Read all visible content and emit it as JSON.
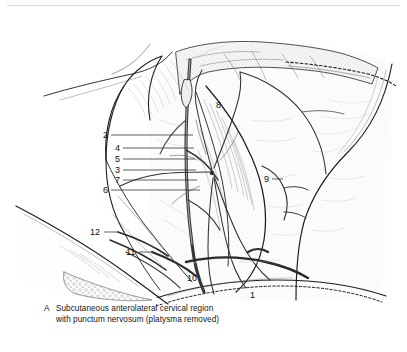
{
  "figure": {
    "name": "subcutaneous-anterolateral-cervical-region",
    "panel_letter": "A",
    "caption_line1": "Subcutaneous anterolateral cervical region",
    "caption_line2": "with punctum nervosum (platysma removed)",
    "style": {
      "background": "#ffffff",
      "ink": "#1a1a1a",
      "rule_color": "#d9d9d9",
      "leader_color": "#1a1a1a"
    },
    "labels": [
      {
        "id": "1",
        "text": "1",
        "x": 250,
        "y": 291,
        "leader": false
      },
      {
        "id": "2",
        "text": "2",
        "x": 103,
        "y": 131,
        "leader": true,
        "lx1": 111,
        "ly1": 135,
        "lx2": 193,
        "ly2": 135
      },
      {
        "id": "3",
        "text": "3",
        "x": 115,
        "y": 166,
        "leader": true,
        "lx1": 123,
        "ly1": 170,
        "lx2": 196,
        "ly2": 170
      },
      {
        "id": "4",
        "text": "4",
        "x": 115,
        "y": 144,
        "leader": true,
        "lx1": 123,
        "ly1": 148,
        "lx2": 194,
        "ly2": 148
      },
      {
        "id": "5",
        "text": "5",
        "x": 115,
        "y": 155,
        "leader": true,
        "lx1": 123,
        "ly1": 159,
        "lx2": 195,
        "ly2": 159
      },
      {
        "id": "6",
        "text": "6",
        "x": 103,
        "y": 186,
        "leader": true,
        "lx1": 111,
        "ly1": 190,
        "lx2": 200,
        "ly2": 190
      },
      {
        "id": "7",
        "text": "7",
        "x": 115,
        "y": 176,
        "leader": true,
        "lx1": 123,
        "ly1": 180,
        "lx2": 197,
        "ly2": 180
      },
      {
        "id": "8",
        "text": "8",
        "x": 216,
        "y": 101,
        "leader": false
      },
      {
        "id": "9",
        "text": "9",
        "x": 264,
        "y": 175,
        "leader": true,
        "lx1": 272,
        "ly1": 179,
        "lx2": 283,
        "ly2": 179
      },
      {
        "id": "10",
        "text": "10",
        "x": 187,
        "y": 274,
        "leader": false
      },
      {
        "id": "11",
        "text": "11",
        "x": 126,
        "y": 248,
        "leader": true,
        "lx1": 139,
        "ly1": 252,
        "lx2": 152,
        "ly2": 252
      },
      {
        "id": "12",
        "text": "12",
        "x": 90,
        "y": 228,
        "leader": true,
        "lx1": 104,
        "ly1": 232,
        "lx2": 118,
        "ly2": 232
      }
    ]
  }
}
